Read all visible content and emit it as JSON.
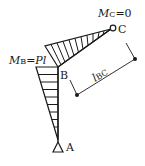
{
  "diagram": {
    "type": "bending-moment-diagram",
    "nodes": {
      "A": {
        "label": "A",
        "support": "pin-triangle"
      },
      "B": {
        "label": "B"
      },
      "C": {
        "label": "C",
        "support": "hinge-circle"
      }
    },
    "moment_labels": {
      "MC": {
        "symbol": "M",
        "subscript": "C",
        "value_text": "=0"
      },
      "MB": {
        "symbol": "M",
        "subscript": "B",
        "value_text": "=Pl"
      }
    },
    "dimension": {
      "symbol": "l",
      "subscript": "BC"
    },
    "colors": {
      "line": "#1a1a1a",
      "background": "#ffffff"
    }
  }
}
